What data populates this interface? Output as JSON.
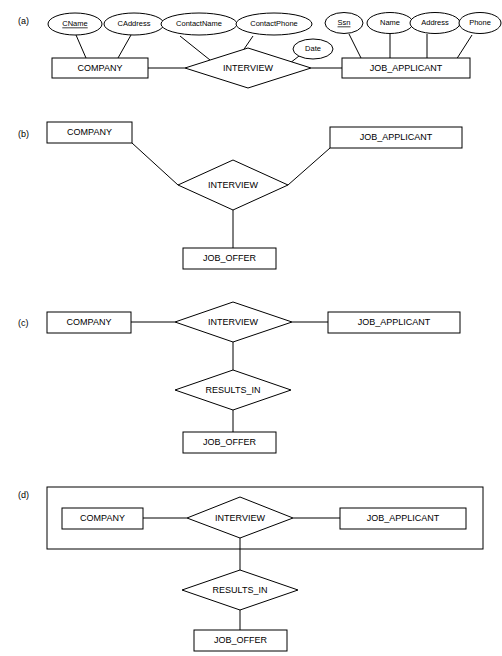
{
  "figure": {
    "background_color": "#ffffff",
    "line_color": "#000000",
    "fill_color": "#ffffff"
  },
  "parts": [
    {
      "id": "a",
      "label": "(a)"
    },
    {
      "id": "b",
      "label": "(b)"
    },
    {
      "id": "c",
      "label": "(c)"
    },
    {
      "id": "d",
      "label": "(d)"
    }
  ],
  "entities": {
    "company": "COMPANY",
    "job_applicant": "JOB_APPLICANT",
    "job_offer": "JOB_OFFER"
  },
  "relationships": {
    "interview": "INTERVIEW",
    "results_in": "RESULTS_IN"
  },
  "part_a": {
    "label": "(a)",
    "entities": [
      {
        "name": "COMPANY"
      },
      {
        "name": "JOB_APPLICANT"
      }
    ],
    "relationship": {
      "name": "INTERVIEW"
    },
    "attributes": [
      {
        "name": "CName",
        "owner": "COMPANY",
        "key": true
      },
      {
        "name": "CAddress",
        "owner": "COMPANY",
        "key": false
      },
      {
        "name": "ContactName",
        "owner": "INTERVIEW",
        "key": false
      },
      {
        "name": "ContactPhone",
        "owner": "INTERVIEW",
        "key": false
      },
      {
        "name": "Date",
        "owner": "INTERVIEW",
        "key": false
      },
      {
        "name": "Ssn",
        "owner": "JOB_APPLICANT",
        "key": true
      },
      {
        "name": "Name",
        "owner": "JOB_APPLICANT",
        "key": false
      },
      {
        "name": "Address",
        "owner": "JOB_APPLICANT",
        "key": false
      },
      {
        "name": "Phone",
        "owner": "JOB_APPLICANT",
        "key": false
      }
    ]
  },
  "part_b": {
    "label": "(b)",
    "entities": [
      "COMPANY",
      "JOB_APPLICANT",
      "JOB_OFFER"
    ],
    "relationship": "INTERVIEW",
    "note": "ternary relationship INTERVIEW connects COMPANY, JOB_APPLICANT and JOB_OFFER"
  },
  "part_c": {
    "label": "(c)",
    "entities": [
      "COMPANY",
      "JOB_APPLICANT",
      "JOB_OFFER"
    ],
    "relationships": [
      "INTERVIEW",
      "RESULTS_IN"
    ],
    "note": "binary INTERVIEW between COMPANY and JOB_APPLICANT, RESULTS_IN to JOB_OFFER"
  },
  "part_d": {
    "label": "(d)",
    "entities": [
      "COMPANY",
      "JOB_APPLICANT",
      "JOB_OFFER"
    ],
    "relationships": [
      "INTERVIEW",
      "RESULTS_IN"
    ],
    "aggregation_box": true,
    "note": "aggregation box encloses COMPANY, INTERVIEW and JOB_APPLICANT"
  }
}
